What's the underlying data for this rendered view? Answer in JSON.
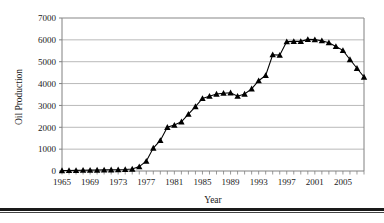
{
  "chart_data": {
    "type": "line",
    "title": "",
    "xlabel": "Year",
    "ylabel": "Oil Production",
    "xlim": [
      1965,
      2008
    ],
    "ylim": [
      0,
      7000
    ],
    "ytick_values": [
      0,
      1000,
      2000,
      3000,
      4000,
      5000,
      6000,
      7000
    ],
    "ytick_labels": [
      "0",
      "1000",
      "2000",
      "3000",
      "4000",
      "5000",
      "6000",
      "7000"
    ],
    "xtick_labels": [
      "1965",
      "1969",
      "1973",
      "1977",
      "1981",
      "1985",
      "1989",
      "1993",
      "1997",
      "2001",
      "2005"
    ],
    "xtick_label_values": [
      1965,
      1969,
      1973,
      1977,
      1981,
      1985,
      1989,
      1993,
      1997,
      2001,
      2005
    ],
    "xtick_minor_step": 1,
    "grid": "horizontal",
    "legend": "none",
    "marker": "triangle",
    "line_color": "#000000",
    "marker_color": "#000000",
    "grid_color": "#999999",
    "axis_color": "#808080",
    "x": [
      1965,
      1966,
      1967,
      1968,
      1969,
      1970,
      1971,
      1972,
      1973,
      1974,
      1975,
      1976,
      1977,
      1978,
      1979,
      1980,
      1981,
      1982,
      1983,
      1984,
      1985,
      1986,
      1987,
      1988,
      1989,
      1990,
      1991,
      1992,
      1993,
      1994,
      1995,
      1996,
      1997,
      1998,
      1999,
      2000,
      2001,
      2002,
      2003,
      2004,
      2005,
      2006,
      2007,
      2008
    ],
    "values": [
      20,
      25,
      30,
      35,
      40,
      45,
      50,
      55,
      60,
      70,
      90,
      200,
      450,
      1050,
      1400,
      2000,
      2100,
      2250,
      2600,
      2950,
      3320,
      3420,
      3520,
      3560,
      3580,
      3420,
      3520,
      3760,
      4130,
      4370,
      5320,
      5300,
      5920,
      5930,
      5930,
      6020,
      6010,
      5960,
      5870,
      5700,
      5520,
      5100,
      4700,
      4300
    ]
  }
}
